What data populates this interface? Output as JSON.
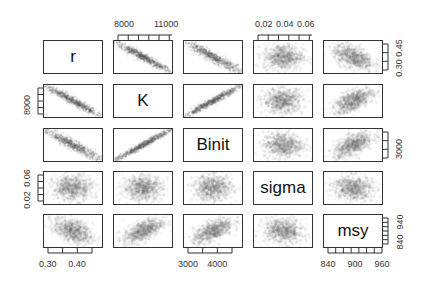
{
  "chart_data": {
    "type": "scatter",
    "subtype": "pairs-matrix",
    "title": "",
    "variables": [
      "r",
      "K",
      "Binit",
      "sigma",
      "msy"
    ],
    "point_color": "#555555",
    "point_alpha": 0.08,
    "axes": {
      "r": {
        "ticks": [
          "0.30",
          "0.40"
        ],
        "range": [
          0.27,
          0.48
        ],
        "axis_side": "bottom",
        "extra_right_ticks": [
          "0.30",
          "0.45"
        ]
      },
      "K": {
        "ticks": [
          "8000",
          "11000"
        ],
        "range": [
          6500,
          13000
        ],
        "axis_side": "top",
        "left_ticks": [
          "8000"
        ]
      },
      "Binit": {
        "ticks": [
          "3000",
          "4000"
        ],
        "range": [
          2500,
          4800
        ],
        "axis_side": "bottom",
        "right_ticks": [
          "3000"
        ]
      },
      "sigma": {
        "ticks": [
          "0.02",
          "0.04",
          "0.06"
        ],
        "range": [
          0.01,
          0.065
        ],
        "axis_side": "top",
        "left_ticks": [
          "0.02",
          "0.06"
        ]
      },
      "msy": {
        "ticks": [
          "840",
          "900",
          "960"
        ],
        "range": [
          820,
          970
        ],
        "axis_side": "bottom",
        "right_ticks": [
          "840",
          "940"
        ]
      }
    },
    "correlations": {
      "r-K": -0.97,
      "r-Binit": -0.95,
      "r-sigma": 0.0,
      "r-msy": -0.45,
      "K-Binit": 0.98,
      "K-sigma": 0.0,
      "K-msy": 0.6,
      "Binit-sigma": 0.0,
      "Binit-msy": 0.6,
      "sigma-msy": -0.1
    },
    "grid": false,
    "legend": null
  },
  "labels": {
    "top_axis": [
      {
        "col": 1,
        "ticks": [
          "8000",
          "11000"
        ]
      },
      {
        "col": 3,
        "ticks": [
          "0.02",
          "0.04",
          "0.06"
        ]
      }
    ],
    "bottom_axis": [
      {
        "col": 0,
        "ticks": [
          "0.30",
          "0.40"
        ]
      },
      {
        "col": 2,
        "ticks": [
          "3000",
          "4000"
        ]
      },
      {
        "col": 4,
        "ticks": [
          "840",
          "900",
          "960"
        ]
      }
    ],
    "left_axis": [
      {
        "row": 1,
        "ticks": [
          "8000"
        ]
      },
      {
        "row": 3,
        "ticks": [
          "0.02",
          "0.06"
        ]
      }
    ],
    "right_axis": [
      {
        "row": 0,
        "ticks": [
          "0.30",
          "0.45"
        ]
      },
      {
        "row": 2,
        "ticks": [
          "3000"
        ]
      },
      {
        "row": 4,
        "ticks": [
          "840",
          "940"
        ]
      }
    ]
  }
}
